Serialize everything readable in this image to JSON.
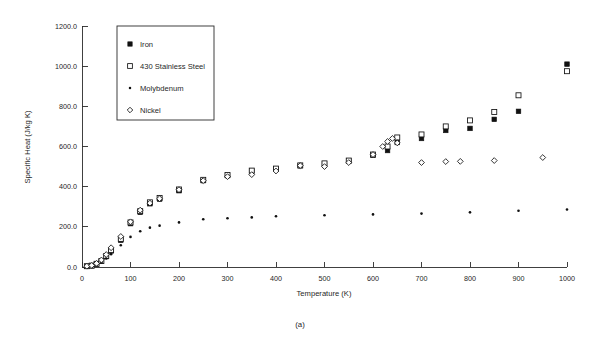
{
  "figure": {
    "caption": "(a)"
  },
  "chart_data": {
    "type": "scatter",
    "title": "",
    "xlabel": "Temperature (K)",
    "ylabel": "Specific Heat (J/kg K)",
    "xlim": [
      0,
      1000
    ],
    "ylim": [
      0,
      1200
    ],
    "xticks": [
      0,
      100,
      200,
      300,
      400,
      500,
      600,
      700,
      800,
      900,
      1000
    ],
    "xtick_labels": [
      "0",
      "100",
      "200",
      "300",
      "400",
      "500",
      "600",
      "700",
      "800",
      "900",
      "1000"
    ],
    "yticks": [
      0,
      200,
      400,
      600,
      800,
      1000,
      1200
    ],
    "ytick_labels": [
      "0.0",
      "200.0",
      "400.0",
      "600.0",
      "800.0",
      "1000.0",
      "1200.0"
    ],
    "grid": false,
    "legend_position": "upper-left-inside",
    "series": [
      {
        "name": "Iron",
        "marker": "filled-square",
        "color": "#111111",
        "points": [
          [
            10,
            3
          ],
          [
            20,
            6
          ],
          [
            30,
            14
          ],
          [
            40,
            28
          ],
          [
            50,
            52
          ],
          [
            60,
            80
          ],
          [
            80,
            133
          ],
          [
            100,
            216
          ],
          [
            120,
            272
          ],
          [
            140,
            315
          ],
          [
            160,
            338
          ],
          [
            200,
            380
          ],
          [
            250,
            430
          ],
          [
            300,
            455
          ],
          [
            350,
            478
          ],
          [
            400,
            487
          ],
          [
            450,
            504
          ],
          [
            500,
            513
          ],
          [
            550,
            528
          ],
          [
            600,
            556
          ],
          [
            630,
            580
          ],
          [
            650,
            620
          ],
          [
            700,
            640
          ],
          [
            750,
            680
          ],
          [
            800,
            690
          ],
          [
            850,
            735
          ],
          [
            900,
            775
          ],
          [
            1000,
            1010
          ]
        ]
      },
      {
        "name": "430 Stainless Steel",
        "marker": "open-square",
        "color": "#111111",
        "points": [
          [
            10,
            4
          ],
          [
            20,
            7
          ],
          [
            30,
            16
          ],
          [
            40,
            30
          ],
          [
            50,
            55
          ],
          [
            60,
            84
          ],
          [
            80,
            140
          ],
          [
            100,
            222
          ],
          [
            120,
            278
          ],
          [
            140,
            322
          ],
          [
            160,
            344
          ],
          [
            200,
            386
          ],
          [
            250,
            434
          ],
          [
            300,
            458
          ],
          [
            350,
            480
          ],
          [
            400,
            490
          ],
          [
            450,
            506
          ],
          [
            500,
            516
          ],
          [
            550,
            530
          ],
          [
            600,
            560
          ],
          [
            630,
            600
          ],
          [
            650,
            645
          ],
          [
            700,
            660
          ],
          [
            750,
            700
          ],
          [
            800,
            730
          ],
          [
            850,
            772
          ],
          [
            900,
            855
          ],
          [
            1000,
            975
          ]
        ]
      },
      {
        "name": "Molybdenum",
        "marker": "dot",
        "color": "#111111",
        "points": [
          [
            10,
            2
          ],
          [
            20,
            5
          ],
          [
            30,
            12
          ],
          [
            40,
            24
          ],
          [
            50,
            42
          ],
          [
            60,
            64
          ],
          [
            80,
            108
          ],
          [
            100,
            150
          ],
          [
            120,
            178
          ],
          [
            140,
            196
          ],
          [
            160,
            206
          ],
          [
            200,
            222
          ],
          [
            250,
            238
          ],
          [
            300,
            243
          ],
          [
            350,
            247
          ],
          [
            400,
            253
          ],
          [
            500,
            258
          ],
          [
            600,
            262
          ],
          [
            700,
            266
          ],
          [
            800,
            272
          ],
          [
            900,
            280
          ],
          [
            1000,
            286
          ]
        ]
      },
      {
        "name": "Nickel",
        "marker": "open-diamond",
        "color": "#111111",
        "points": [
          [
            10,
            4
          ],
          [
            20,
            8
          ],
          [
            30,
            18
          ],
          [
            40,
            35
          ],
          [
            50,
            62
          ],
          [
            60,
            96
          ],
          [
            80,
            152
          ],
          [
            100,
            225
          ],
          [
            120,
            283
          ],
          [
            140,
            318
          ],
          [
            160,
            340
          ],
          [
            200,
            385
          ],
          [
            250,
            430
          ],
          [
            300,
            450
          ],
          [
            350,
            460
          ],
          [
            400,
            478
          ],
          [
            450,
            505
          ],
          [
            500,
            500
          ],
          [
            550,
            520
          ],
          [
            600,
            560
          ],
          [
            620,
            600
          ],
          [
            630,
            625
          ],
          [
            640,
            640
          ],
          [
            650,
            618
          ],
          [
            700,
            520
          ],
          [
            750,
            525
          ],
          [
            780,
            526
          ],
          [
            850,
            530
          ],
          [
            950,
            545
          ]
        ]
      }
    ]
  },
  "legend": {
    "items": [
      {
        "label": "Iron",
        "marker": "filled-square"
      },
      {
        "label": "430 Stainless Steel",
        "marker": "open-square"
      },
      {
        "label": "Molybdenum",
        "marker": "dot"
      },
      {
        "label": "Nickel",
        "marker": "open-diamond"
      }
    ]
  }
}
